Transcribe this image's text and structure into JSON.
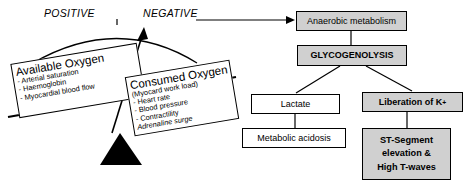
{
  "diagram": {
    "scale": {
      "positive_label": "POSITIVE",
      "negative_label": "NEGATIVE"
    },
    "pans": [
      {
        "id": "available-oxygen",
        "title": "Available Oxygen",
        "items": [
          "Arterial saturation",
          "Haemoglobin",
          "Myocardial blood flow"
        ]
      },
      {
        "id": "consumed-oxygen",
        "title": "Consumed Oxygen",
        "subtitle": "(Myocard work load)",
        "items": [
          "Heart rate",
          "Blood pressure",
          "Contractility"
        ],
        "emphasis_item": "Adrenaline surge"
      }
    ],
    "flow": {
      "anaerobic": "Anaerobic metabolism",
      "glycogenolysis": "GLYCOGENOLYSIS",
      "lactate": "Lactate",
      "acidosis": "Metabolic acidosis",
      "potassium": "Liberation of K",
      "potassium_superscript": "+",
      "st_line1": "ST-Segment",
      "st_line2": "elevation  &",
      "st_line3": "High T-waves"
    },
    "colors": {
      "box_fill_gray": "#d0d0d0",
      "box_fill_white": "#ffffff",
      "stroke": "#000000",
      "background": "#ffffff"
    }
  }
}
